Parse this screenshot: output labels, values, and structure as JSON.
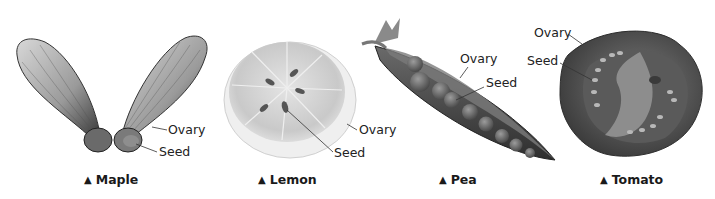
{
  "figure": {
    "panels": [
      {
        "id": "maple",
        "caption": "Maple",
        "caption_marker": "▲",
        "labels": {
          "ovary": "Ovary",
          "seed": "Seed"
        }
      },
      {
        "id": "lemon",
        "caption": "Lemon",
        "caption_marker": "▲",
        "labels": {
          "ovary": "Ovary",
          "seed": "Seed"
        }
      },
      {
        "id": "pea",
        "caption": "Pea",
        "caption_marker": "▲",
        "labels": {
          "ovary": "Ovary",
          "seed": "Seed"
        }
      },
      {
        "id": "tomato",
        "caption": "Tomato",
        "caption_marker": "▲",
        "labels": {
          "ovary": "Ovary",
          "seed": "Seed"
        }
      }
    ],
    "colors": {
      "background": "#ffffff",
      "text": "#1a1a1a",
      "leader_line": "#333333"
    }
  }
}
